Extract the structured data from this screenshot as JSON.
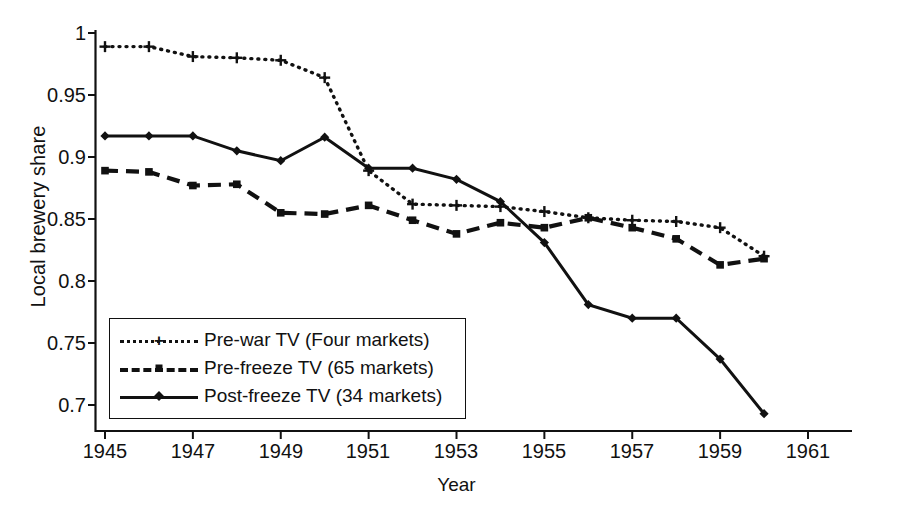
{
  "chart_data": {
    "type": "line",
    "title": "",
    "xlabel": "Year",
    "ylabel": "Local brewery share",
    "xlim": [
      1945,
      1961
    ],
    "ylim": [
      0.7,
      1.0
    ],
    "xticks": [
      1945,
      1947,
      1949,
      1951,
      1953,
      1955,
      1957,
      1959,
      1961
    ],
    "xtick_labels": [
      "1945",
      "1947",
      "1949",
      "1951",
      "1953",
      "1955",
      "1957",
      "1959",
      "1961"
    ],
    "yticks": [
      0.7,
      0.75,
      0.8,
      0.85,
      0.9,
      0.95,
      1.0
    ],
    "ytick_labels": [
      "0.7",
      "0.75",
      "0.8",
      "0.85",
      "0.9",
      "0.95",
      "1"
    ],
    "grid": false,
    "legend_position": "lower-left-inside",
    "x": [
      1945,
      1946,
      1947,
      1948,
      1949,
      1950,
      1951,
      1952,
      1953,
      1954,
      1955,
      1956,
      1957,
      1958,
      1959,
      1960
    ],
    "series": [
      {
        "name": "Pre-war TV (Four markets)",
        "line_style": "dotted",
        "marker": "plus",
        "color": "#111111",
        "values": [
          0.989,
          0.989,
          0.981,
          0.98,
          0.978,
          0.964,
          0.889,
          0.862,
          0.861,
          0.86,
          0.856,
          0.851,
          0.849,
          0.848,
          0.843,
          0.82
        ]
      },
      {
        "name": "Pre-freeze TV (65 markets)",
        "line_style": "dashed",
        "marker": "square",
        "color": "#111111",
        "values": [
          0.889,
          0.888,
          0.877,
          0.878,
          0.855,
          0.854,
          0.861,
          0.849,
          0.838,
          0.847,
          0.843,
          0.851,
          0.843,
          0.834,
          0.813,
          0.818
        ]
      },
      {
        "name": "Post-freeze TV (34 markets)",
        "line_style": "solid",
        "marker": "diamond",
        "color": "#111111",
        "values": [
          0.917,
          0.917,
          0.917,
          0.905,
          0.897,
          0.916,
          0.891,
          0.891,
          0.882,
          0.864,
          0.831,
          0.781,
          0.77,
          0.77,
          0.737,
          0.693
        ]
      }
    ]
  },
  "legend": {
    "entries": [
      {
        "label": "Pre-war TV (Four markets)"
      },
      {
        "label": "Pre-freeze TV (65 markets)"
      },
      {
        "label": "Post-freeze TV (34 markets)"
      }
    ]
  }
}
